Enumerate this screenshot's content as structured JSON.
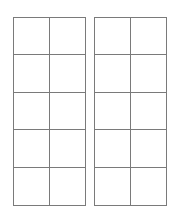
{
  "diagram": {
    "type": "ten-frame-pair",
    "line_color": "#7a7a7a",
    "background": "#ffffff",
    "frames": [
      {
        "id": "left",
        "rows": 5,
        "columns": 2,
        "cells": [
          "",
          "",
          "",
          "",
          "",
          "",
          "",
          "",
          "",
          ""
        ]
      },
      {
        "id": "right",
        "rows": 5,
        "columns": 2,
        "cells": [
          "",
          "",
          "",
          "",
          "",
          "",
          "",
          "",
          "",
          ""
        ]
      }
    ]
  }
}
